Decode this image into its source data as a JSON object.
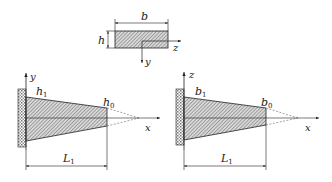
{
  "cross_section": {
    "width_label": "b",
    "height_label": "h",
    "axis_horizontal": "z",
    "axis_vertical": "y"
  },
  "front_view": {
    "axis_vertical": "y",
    "axis_horizontal": "x",
    "root_label_main": "h",
    "root_label_sub": "1",
    "tip_label_main": "h",
    "tip_label_sub": "0",
    "length_label_main": "L",
    "length_label_sub": "1"
  },
  "top_view": {
    "axis_vertical": "z",
    "axis_horizontal": "x",
    "root_label_main": "b",
    "root_label_sub": "1",
    "tip_label_main": "b",
    "tip_label_sub": "0",
    "length_label_main": "L",
    "length_label_sub": "1"
  },
  "colors": {
    "line": "#222222",
    "hatch": "#8a8a8a",
    "background": "#ffffff"
  }
}
